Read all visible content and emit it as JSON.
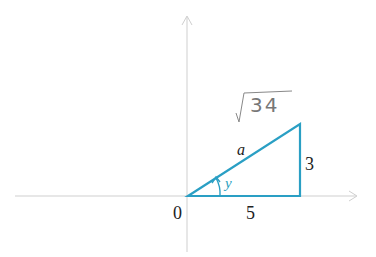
{
  "diagram": {
    "type": "right-triangle-on-axes",
    "labels": {
      "origin": "0",
      "adjacent": "5",
      "opposite": "3",
      "hypotenuse": "a",
      "angle": "y",
      "handwritten_hypotenuse": "√34"
    },
    "colors": {
      "triangle": "#2a9fc4",
      "axes": "#c8c8c8",
      "text": "#222222",
      "handwriting": "#777777"
    }
  }
}
